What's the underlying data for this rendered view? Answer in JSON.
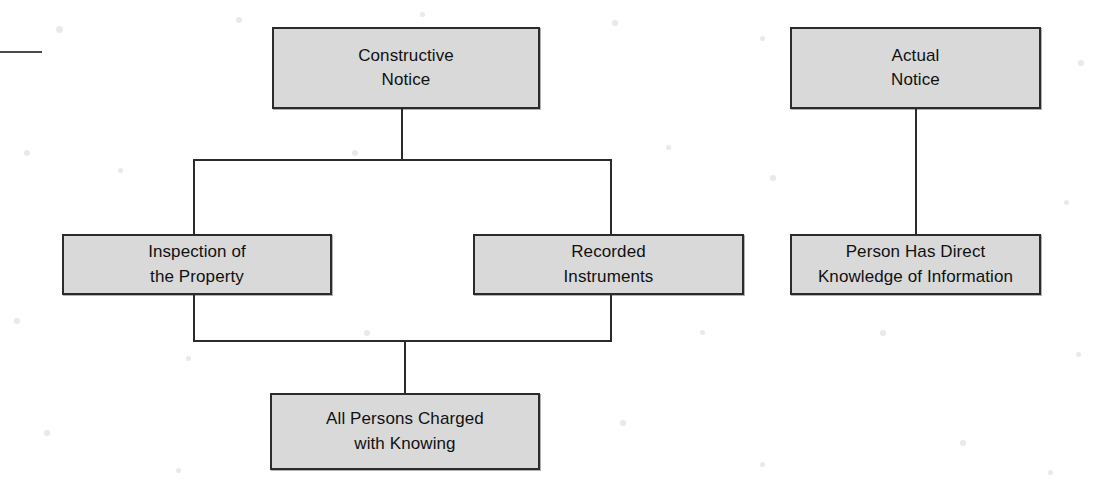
{
  "diagram": {
    "background_color": "#ffffff",
    "box_fill_color": "#d9d9d9",
    "box_border_color": "#2b2b2b",
    "connector_color": "#2b2b2b",
    "nodes": [
      {
        "id": "constructive-notice",
        "label": "Constructive\nNotice",
        "x": 272,
        "y": 27,
        "w": 268,
        "h": 82
      },
      {
        "id": "actual-notice",
        "label": "Actual\nNotice",
        "x": 790,
        "y": 27,
        "w": 251,
        "h": 82
      },
      {
        "id": "inspection-of-the-property",
        "label": "Inspection of\nthe Property",
        "x": 62,
        "y": 234,
        "w": 270,
        "h": 61
      },
      {
        "id": "recorded-instruments",
        "label": "Recorded\nInstruments",
        "x": 473,
        "y": 234,
        "w": 271,
        "h": 61
      },
      {
        "id": "person-has-direct-knowledge",
        "label": "Person Has Direct\nKnowledge of Information",
        "x": 790,
        "y": 234,
        "w": 251,
        "h": 61
      },
      {
        "id": "all-persons-charged-with-knowing",
        "label": "All Persons Charged\nwith Knowing",
        "x": 270,
        "y": 393,
        "w": 270,
        "h": 77
      }
    ],
    "connectors": [
      {
        "id": "constructive-stem-down",
        "orient": "v",
        "x": 401,
        "y": 109,
        "len": 52
      },
      {
        "id": "constructive-split-bar",
        "orient": "h",
        "x": 193,
        "y": 159,
        "len": 419
      },
      {
        "id": "branch-to-inspection",
        "orient": "v",
        "x": 193,
        "y": 159,
        "len": 76
      },
      {
        "id": "branch-to-recorded",
        "orient": "v",
        "x": 610,
        "y": 159,
        "len": 76
      },
      {
        "id": "inspection-stem-down",
        "orient": "v",
        "x": 193,
        "y": 295,
        "len": 47
      },
      {
        "id": "recorded-stem-down",
        "orient": "v",
        "x": 610,
        "y": 295,
        "len": 47
      },
      {
        "id": "merge-bar-to-all-persons",
        "orient": "h",
        "x": 193,
        "y": 340,
        "len": 419
      },
      {
        "id": "all-persons-stem-down",
        "orient": "v",
        "x": 404,
        "y": 340,
        "len": 54
      },
      {
        "id": "actual-notice-stem-down",
        "orient": "v",
        "x": 915,
        "y": 109,
        "len": 126
      }
    ],
    "artifacts": [
      {
        "id": "left-margin-scan-line",
        "x": 0,
        "y": 51,
        "w": 42
      }
    ]
  }
}
